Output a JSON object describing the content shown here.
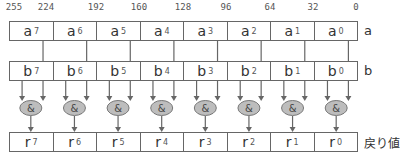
{
  "bit_positions": [
    "255",
    "224",
    "192",
    "160",
    "128",
    "96",
    "64",
    "32",
    "0"
  ],
  "rows": {
    "a": {
      "label": "a",
      "cells": [
        {
          "base": "a",
          "sub": "7"
        },
        {
          "base": "a",
          "sub": "6"
        },
        {
          "base": "a",
          "sub": "5"
        },
        {
          "base": "a",
          "sub": "4"
        },
        {
          "base": "a",
          "sub": "3"
        },
        {
          "base": "a",
          "sub": "2"
        },
        {
          "base": "a",
          "sub": "1"
        },
        {
          "base": "a",
          "sub": "0"
        }
      ]
    },
    "b": {
      "label": "b",
      "cells": [
        {
          "base": "b",
          "sub": "7"
        },
        {
          "base": "b",
          "sub": "6"
        },
        {
          "base": "b",
          "sub": "5"
        },
        {
          "base": "b",
          "sub": "4"
        },
        {
          "base": "b",
          "sub": "3"
        },
        {
          "base": "b",
          "sub": "2"
        },
        {
          "base": "b",
          "sub": "1"
        },
        {
          "base": "b",
          "sub": "0"
        }
      ]
    },
    "r": {
      "label": "戻り値",
      "cells": [
        {
          "base": "r",
          "sub": "7"
        },
        {
          "base": "r",
          "sub": "6"
        },
        {
          "base": "r",
          "sub": "5"
        },
        {
          "base": "r",
          "sub": "4"
        },
        {
          "base": "r",
          "sub": "3"
        },
        {
          "base": "r",
          "sub": "2"
        },
        {
          "base": "r",
          "sub": "1"
        },
        {
          "base": "r",
          "sub": "0"
        }
      ]
    }
  },
  "operator": {
    "symbol": "&",
    "fill": "#bdbdbd",
    "stroke": "#777777"
  },
  "colors": {
    "line": "#666666",
    "text": "#333333"
  }
}
